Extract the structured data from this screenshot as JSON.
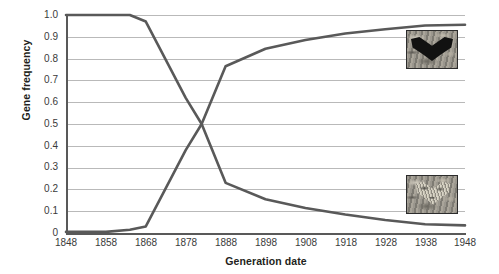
{
  "chart_data": {
    "type": "line",
    "title": "",
    "xlabel": "Generation date",
    "ylabel": "Gene frequency",
    "xlim": [
      1848,
      1948
    ],
    "ylim": [
      0,
      1.0
    ],
    "grid": true,
    "legend": "none",
    "x_ticks": [
      "1848",
      "1858",
      "1868",
      "1878",
      "1888",
      "1898",
      "1908",
      "1918",
      "1928",
      "1938",
      "1948"
    ],
    "y_ticks": [
      "0",
      "0.1",
      "0.2",
      "0.3",
      "0.4",
      "0.5",
      "0.6",
      "0.7",
      "0.8",
      "0.9",
      "1.0"
    ],
    "x": [
      1848,
      1858,
      1864,
      1868,
      1878,
      1882,
      1888,
      1898,
      1908,
      1918,
      1928,
      1938,
      1948
    ],
    "series": [
      {
        "name": "typica (light peppered form) allele frequency",
        "color": "#595959",
        "values": [
          1.0,
          1.0,
          1.0,
          0.97,
          0.62,
          0.5,
          0.23,
          0.155,
          0.115,
          0.085,
          0.06,
          0.04,
          0.035
        ]
      },
      {
        "name": "carbonaria (dark melanic form) allele frequency",
        "color": "#595959",
        "values": [
          0.005,
          0.005,
          0.015,
          0.03,
          0.38,
          0.5,
          0.765,
          0.845,
          0.885,
          0.915,
          0.935,
          0.952,
          0.955
        ]
      }
    ],
    "annotations": [
      {
        "name": "melanic-moth-photo",
        "label": "dark melanic moth on bark",
        "x_value": 1938,
        "y_value": 0.885
      },
      {
        "name": "typica-moth-photo",
        "label": "light peppered moth on lichen",
        "x_value": 1938,
        "y_value": 0.215
      }
    ]
  }
}
